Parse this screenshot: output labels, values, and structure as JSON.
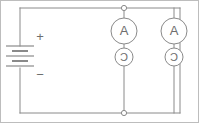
{
  "diagram": {
    "type": "circuit-schematic",
    "background_color": "#ffffff",
    "line_color": "#8a8a8a",
    "frame_color": "#bdbdbd",
    "source": {
      "name": "battery",
      "plus_label": "+",
      "minus_label": "−",
      "cell_count": 3
    },
    "branches": [
      {
        "id": "left-branch",
        "meter_label": "A",
        "meter_name": "ammeter",
        "device_label": "Ɔ",
        "device_name": "lamp"
      },
      {
        "id": "right-branch",
        "meter_label": "A",
        "meter_name": "ammeter",
        "device_label": "Ɔ",
        "device_name": "lamp"
      }
    ],
    "junctions": [
      {
        "id": "top-node",
        "label": ""
      },
      {
        "id": "bottom-node",
        "label": ""
      }
    ]
  }
}
